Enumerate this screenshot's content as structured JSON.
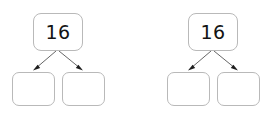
{
  "page": {
    "background_color": "#ffffff",
    "width": 273,
    "height": 117,
    "kind": "number-bond-worksheet"
  },
  "style": {
    "box_border_color": "#b9b9b9",
    "box_fill_color": "#ffffff",
    "arrow_color": "#555555",
    "arrow_head_color": "#1d1d1d",
    "text_color": "#141414"
  },
  "diagrams": [
    {
      "id": "diagram-left",
      "whole": {
        "label": "16",
        "name": "whole-box"
      },
      "parts": [
        {
          "label": "",
          "name": "part-box-left"
        },
        {
          "label": "",
          "name": "part-box-right"
        }
      ],
      "arrows": [
        {
          "name": "arrow-to-left-part"
        },
        {
          "name": "arrow-to-right-part"
        }
      ]
    },
    {
      "id": "diagram-right",
      "whole": {
        "label": "16",
        "name": "whole-box"
      },
      "parts": [
        {
          "label": "",
          "name": "part-box-left"
        },
        {
          "label": "",
          "name": "part-box-right"
        }
      ],
      "arrows": [
        {
          "name": "arrow-to-left-part"
        },
        {
          "name": "arrow-to-right-part"
        }
      ]
    }
  ]
}
